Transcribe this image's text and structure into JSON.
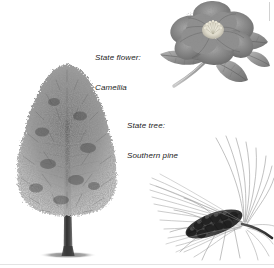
{
  "page": {
    "background_color": "#ffffff",
    "width": 274,
    "height": 268
  },
  "labels": {
    "flower": {
      "line1": "State flower:",
      "line2": "Camellia",
      "color": "#1c1c1c",
      "style": "italic"
    },
    "tree": {
      "line1": "State tree:",
      "line2": "Southern pine",
      "color": "#1c1c1c",
      "style": "italic"
    }
  },
  "illustrations": {
    "tree": {
      "name": "southern-pine-tree",
      "description": "Tall conical pine tree with dense textured canopy, straight dark trunk and elliptical ground shadow",
      "canopy_color": "#8a8a8a",
      "trunk_color": "#4a4a4a",
      "shadow_color": "#9a9a9a"
    },
    "camellia": {
      "name": "camellia-flower",
      "description": "Grayscale botanical illustration of a camellia bloom with layered petals, pale stamen center, pointed leaves and curved stem",
      "petal_color": "#8c8c8c",
      "center_color": "#ececdf",
      "leaf_color": "#9a9a9a",
      "stem_color": "#b4b4b4"
    },
    "pine_branch": {
      "name": "pine-branch-with-cone",
      "description": "Pine branch with long sweeping needles radiating upward and a dark elongated pinecone at the center",
      "needle_color": "#a8a8a8",
      "cone_color": "#3d3d3d"
    }
  },
  "artifacts": {
    "edge_rule_right": "#d2d2d2",
    "edge_rule_bottom": "#e3e3e3"
  }
}
